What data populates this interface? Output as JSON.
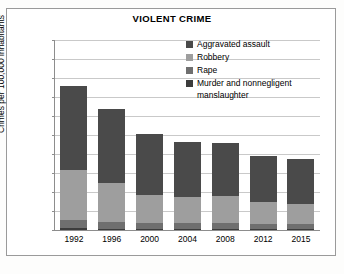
{
  "chart_data": {
    "type": "bar",
    "subtype": "stacked-vertical",
    "title": "VIOLENT CRIME",
    "xlabel": "",
    "ylabel": "Crimes per 100,000 inhabitants",
    "categories": [
      "1992",
      "1996",
      "2000",
      "2004",
      "2008",
      "2012",
      "2015"
    ],
    "ylim": [
      0,
      1000
    ],
    "yticks": [
      0,
      100,
      200,
      300,
      400,
      500,
      600,
      700,
      800,
      900,
      1000
    ],
    "ytick_labels": [
      "0",
      "100",
      "200",
      "300",
      "400",
      "500",
      "600",
      "700",
      "800",
      "900",
      "1,000"
    ],
    "grid": true,
    "legend_position": "inside-top-right",
    "stack_order_bottom_to_top": [
      "Murder and nonnegligent manslaughter",
      "Rape",
      "Robbery",
      "Aggravated assault"
    ],
    "series": [
      {
        "name": "Aggravated assault",
        "color": "#4a4a4a",
        "values": [
          442,
          390,
          324,
          291,
          277,
          243,
          238
        ]
      },
      {
        "name": "Robbery",
        "color": "#9e9e9e",
        "values": [
          264,
          202,
          145,
          137,
          146,
          113,
          102
        ]
      },
      {
        "name": "Rape",
        "color": "#6f6f6f",
        "values": [
          42,
          36,
          32,
          32,
          30,
          27,
          29
        ]
      },
      {
        "name": "Murder and nonnegligent manslaughter",
        "color": "#3c3c3c",
        "values": [
          9,
          7,
          6,
          6,
          5,
          5,
          5
        ]
      }
    ],
    "totals": [
      757,
      635,
      507,
      466,
      458,
      388,
      374
    ]
  },
  "legend": {
    "items": [
      {
        "label": "Aggravated assault",
        "color": "#4a4a4a"
      },
      {
        "label": "Robbery",
        "color": "#9e9e9e"
      },
      {
        "label": "Rape",
        "color": "#6f6f6f"
      },
      {
        "label": "Murder and nonnegligent\n    manslaughter",
        "color": "#3c3c3c"
      }
    ]
  }
}
